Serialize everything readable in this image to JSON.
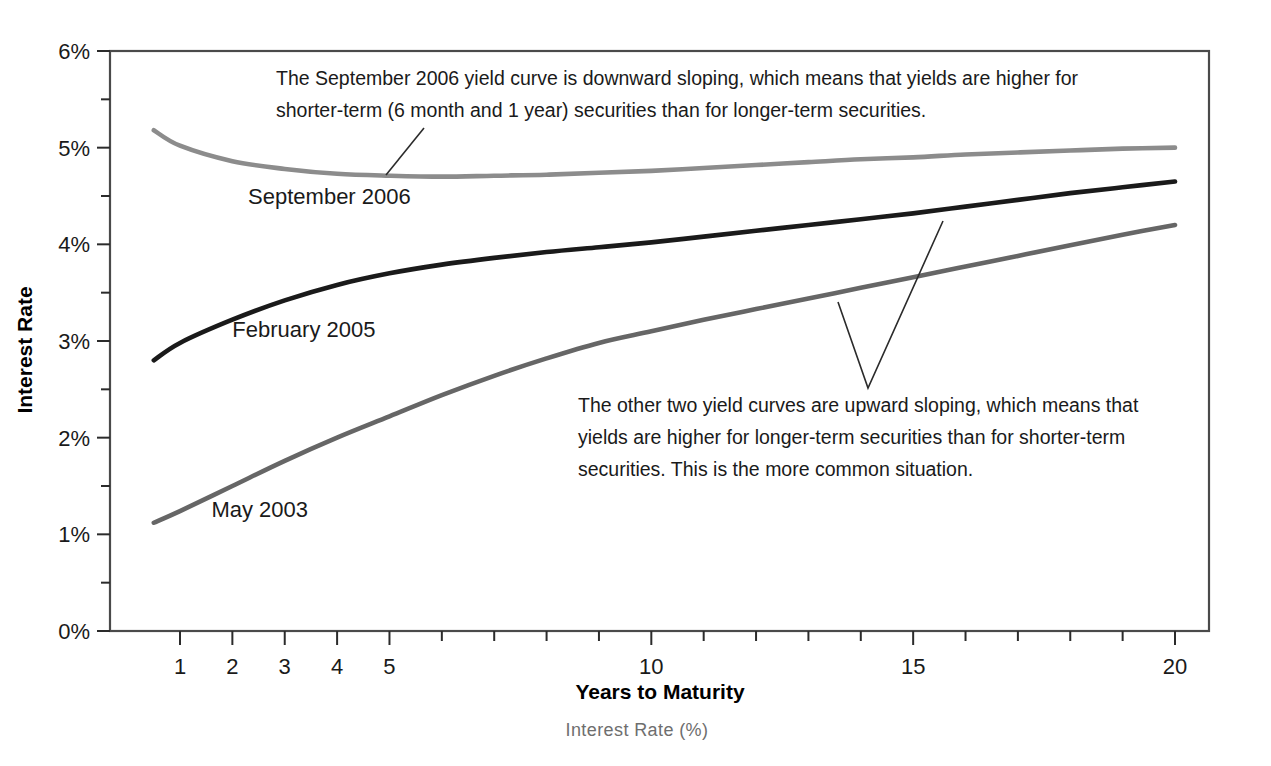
{
  "chart_data": {
    "type": "line",
    "title": "",
    "xlabel": "Years to Maturity",
    "ylabel": "Interest Rate",
    "xlim": [
      0.5,
      20
    ],
    "ylim": [
      0,
      6
    ],
    "grid": false,
    "legend_position": "inline-labels",
    "x_tick_labels": [
      "1",
      "2",
      "3",
      "4",
      "5",
      "10",
      "15",
      "20"
    ],
    "x_tick_values": [
      1,
      2,
      3,
      4,
      5,
      10,
      15,
      20
    ],
    "x_minor_ticks": [
      6,
      7,
      8,
      9,
      11,
      12,
      13,
      14,
      16,
      17,
      18,
      19
    ],
    "y_tick_labels": [
      "0%",
      "1%",
      "2%",
      "3%",
      "4%",
      "5%",
      "6%"
    ],
    "y_tick_values": [
      0,
      1,
      2,
      3,
      4,
      5,
      6
    ],
    "y_minor_ticks": [
      0.5,
      1.5,
      2.5,
      3.5,
      4.5,
      5.5
    ],
    "x": [
      0.5,
      1,
      2,
      3,
      4,
      5,
      6,
      7,
      8,
      9,
      10,
      11,
      12,
      13,
      14,
      15,
      16,
      17,
      18,
      19,
      20
    ],
    "series": [
      {
        "name": "September 2006",
        "color": "#8c8c8c",
        "label_x": 2.3,
        "label_y": 4.42,
        "values": [
          5.18,
          5.02,
          4.86,
          4.78,
          4.73,
          4.71,
          4.7,
          4.71,
          4.72,
          4.74,
          4.76,
          4.79,
          4.82,
          4.85,
          4.88,
          4.9,
          4.93,
          4.95,
          4.97,
          4.99,
          5.0
        ]
      },
      {
        "name": "February 2005",
        "color": "#1a1a1a",
        "label_x": 2.0,
        "label_y": 3.04,
        "values": [
          2.8,
          2.98,
          3.22,
          3.42,
          3.58,
          3.7,
          3.79,
          3.86,
          3.92,
          3.97,
          4.02,
          4.08,
          4.14,
          4.2,
          4.26,
          4.32,
          4.39,
          4.46,
          4.53,
          4.59,
          4.65
        ]
      },
      {
        "name": "May 2003",
        "color": "#666666",
        "label_x": 1.6,
        "label_y": 1.18,
        "values": [
          1.12,
          1.24,
          1.5,
          1.76,
          2.0,
          2.22,
          2.44,
          2.64,
          2.82,
          2.98,
          3.1,
          3.22,
          3.33,
          3.44,
          3.55,
          3.66,
          3.77,
          3.88,
          3.99,
          4.1,
          4.2
        ]
      }
    ],
    "annotations": [
      {
        "id": "annotation-september",
        "lines": [
          "The September 2006 yield curve is downward sloping, which means that yields are higher for",
          "shorter-term (6 month and 1 year) securities than for longer-term securities."
        ]
      },
      {
        "id": "annotation-upward",
        "lines": [
          "The other two yield curves are upward sloping, which means that",
          "yields are higher for longer-term securities than for shorter-term",
          "securities. This is the more common situation."
        ]
      }
    ]
  },
  "caption": "Interest Rate (%)"
}
